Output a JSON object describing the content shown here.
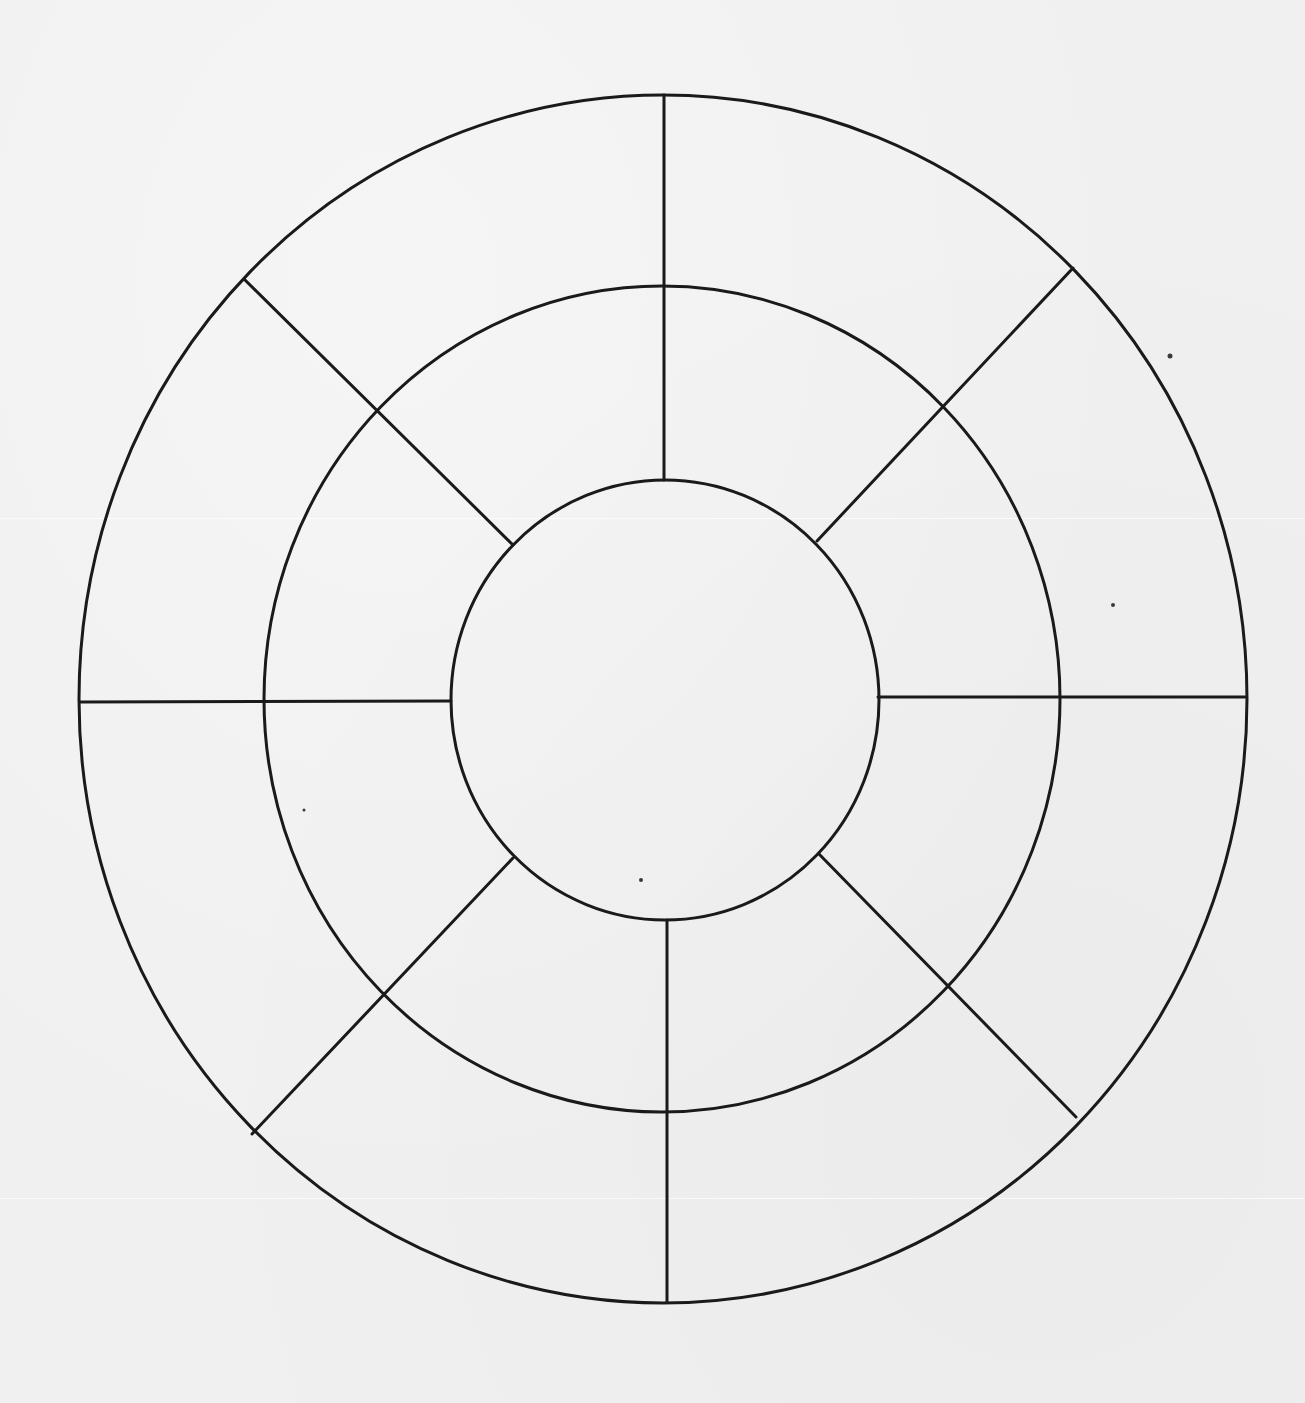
{
  "diagram": {
    "type": "segmented-concentric-wheel",
    "rings": 3,
    "segments_outer": 8,
    "segments_middle": 8,
    "center_segments": 1,
    "line_color": "#1a1a1a",
    "background_color": "#f0f0f0",
    "geometry": {
      "center": [
        664,
        699
      ],
      "outer": {
        "rx": 584,
        "ry": 604
      },
      "middle": {
        "rx": 398,
        "ry": 413
      },
      "inner": {
        "rx": 214,
        "ry": 220
      }
    },
    "labels": []
  }
}
